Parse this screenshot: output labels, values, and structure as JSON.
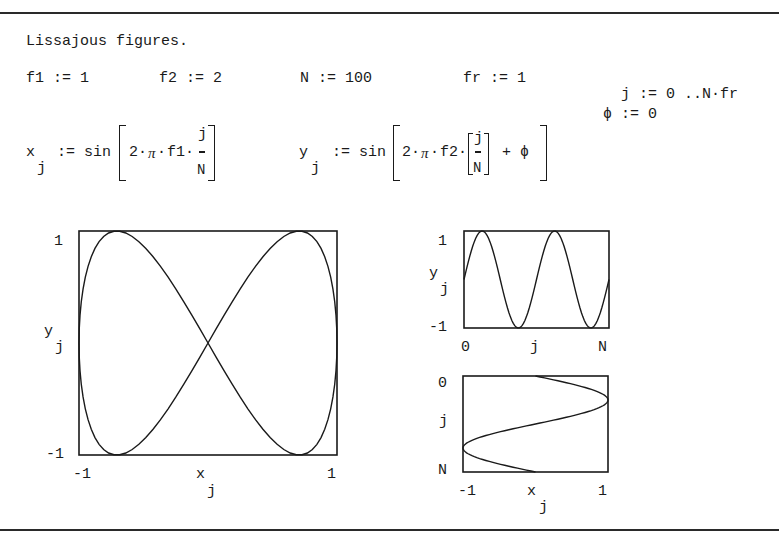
{
  "title": "Lissajous figures.",
  "definitions": {
    "f1": "f1 := 1",
    "f2": "f2 := 2",
    "N": "N := 100",
    "fr": "fr := 1",
    "j_range": "j := 0 ..N",
    "j_range_tail": "fr",
    "phi": "ϕ := 0"
  },
  "equations": {
    "x_lhs": "x",
    "x_sub": "j",
    "assign": ":= sin",
    "x_body": "2",
    "pi": "π",
    "f1": "f1",
    "frac_num": "j",
    "frac_den": "N",
    "y_lhs": "y",
    "y_sub": "j",
    "f2": "f2",
    "plus_phi": "+ ϕ"
  },
  "plots": {
    "lissajous": {
      "y_tick_top": "1",
      "y_tick_bottom": "-1",
      "x_tick_left": "-1",
      "x_tick_right": "1",
      "ylabel": "y",
      "ylabel_sub": "j",
      "xlabel": "x",
      "xlabel_sub": "j"
    },
    "y_vs_j": {
      "y_tick_top": "1",
      "y_tick_bottom": "-1",
      "x_tick_left": "0",
      "x_tick_right": "N",
      "ylabel": "y",
      "ylabel_sub": "j",
      "xlabel": "j"
    },
    "j_vs_x": {
      "y_tick_top": "0",
      "y_tick_bottom": "N",
      "x_tick_left": "-1",
      "x_tick_right": "1",
      "ylabel": "j",
      "xlabel": "x",
      "xlabel_sub": "j"
    }
  },
  "chart_data": [
    {
      "type": "line",
      "title": "Lissajous figure",
      "xlabel": "x_j",
      "ylabel": "y_j",
      "xlim": [
        -1,
        1
      ],
      "ylim": [
        -1,
        1
      ],
      "x_expr": "sin(2*pi*f1*j/N)",
      "y_expr": "sin(2*pi*f2*j/N + phi)",
      "params": {
        "f1": 1,
        "f2": 2,
        "N": 100,
        "fr": 1,
        "phi": 0
      },
      "j": [
        0,
        100
      ],
      "grid": false
    },
    {
      "type": "line",
      "title": "y_j versus j",
      "xlabel": "j",
      "ylabel": "y_j",
      "xlim": [
        0,
        100
      ],
      "ylim": [
        -1,
        1
      ],
      "x_ticks": [
        "0",
        "N"
      ],
      "y_ticks": [
        "1",
        "-1"
      ],
      "expr": "sin(2*pi*2*j/100)",
      "grid": false
    },
    {
      "type": "line",
      "title": "j versus x_j",
      "xlabel": "x_j",
      "ylabel": "j",
      "xlim": [
        -1,
        1
      ],
      "ylim": [
        0,
        100
      ],
      "x_ticks": [
        "-1",
        "1"
      ],
      "y_ticks": [
        "0",
        "N"
      ],
      "expr": "sin(2*pi*j/100)",
      "grid": false
    }
  ]
}
